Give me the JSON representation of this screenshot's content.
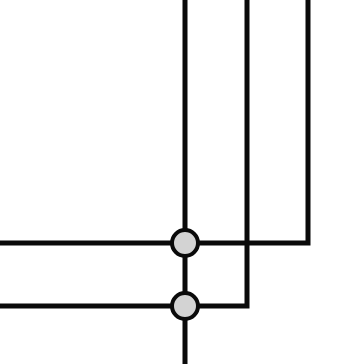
{
  "diagram": {
    "type": "wiring-junction",
    "background": "#ffffff",
    "line_color": "#0a0a0a",
    "line_width": 5,
    "junction_fill": "#d3d3d3",
    "junction_stroke": "#0a0a0a",
    "junction_radius": 13,
    "junction_stroke_width": 4,
    "wires": [
      {
        "id": "main-vertical",
        "points": [
          [
            185,
            0
          ],
          [
            185,
            364
          ]
        ]
      },
      {
        "id": "upper-wire",
        "points": [
          [
            0,
            243
          ],
          [
            308,
            243
          ],
          [
            308,
            0
          ]
        ]
      },
      {
        "id": "lower-wire",
        "points": [
          [
            0,
            306
          ],
          [
            247,
            306
          ],
          [
            247,
            0
          ]
        ]
      }
    ],
    "junctions": [
      {
        "id": "junction-upper",
        "cx": 185,
        "cy": 243
      },
      {
        "id": "junction-lower",
        "cx": 185,
        "cy": 306
      }
    ]
  }
}
